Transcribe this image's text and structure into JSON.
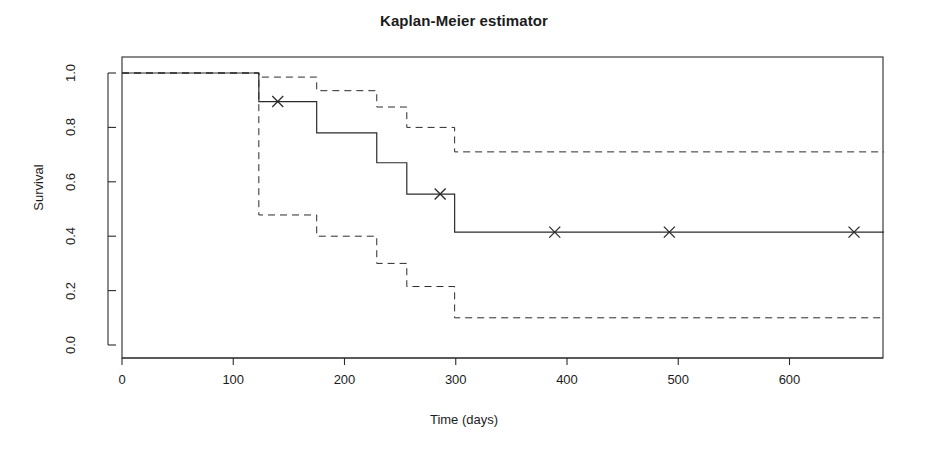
{
  "chart_data": {
    "type": "line",
    "title": "Kaplan-Meier estimator",
    "xlabel": "Time (days)",
    "ylabel": "Survival",
    "xlim": [
      0,
      685
    ],
    "ylim": [
      0.0,
      1.0
    ],
    "grid": false,
    "legend": null,
    "xticks": [
      0,
      100,
      200,
      300,
      400,
      500,
      600
    ],
    "xtick_labels": [
      "0",
      "100",
      "200",
      "300",
      "400",
      "500",
      "600"
    ],
    "yticks": [
      0.0,
      0.2,
      0.4,
      0.6,
      0.8,
      1.0
    ],
    "ytick_labels": [
      "0.0",
      "0.2",
      "0.4",
      "0.6",
      "0.8",
      "1.0"
    ],
    "series": [
      {
        "name": "Survival estimate",
        "style": "solid",
        "x": [
          0,
          123,
          175,
          229,
          256,
          299,
          685
        ],
        "y": [
          1.0,
          0.895,
          0.78,
          0.67,
          0.555,
          0.415,
          0.415
        ]
      },
      {
        "name": "Upper 95% confidence limit",
        "style": "dashed",
        "x": [
          0,
          123,
          175,
          229,
          256,
          299,
          685
        ],
        "y": [
          1.0,
          0.985,
          0.935,
          0.875,
          0.8,
          0.71,
          0.71
        ]
      },
      {
        "name": "Lower 95% confidence limit",
        "style": "dashed",
        "x": [
          0,
          123,
          175,
          229,
          256,
          299,
          685
        ],
        "y": [
          1.0,
          0.478,
          0.4,
          0.3,
          0.215,
          0.1,
          0.1
        ]
      }
    ],
    "censored_marks": {
      "symbol": "x",
      "points": [
        {
          "x": 140,
          "y": 0.895
        },
        {
          "x": 286,
          "y": 0.555
        },
        {
          "x": 389,
          "y": 0.415
        },
        {
          "x": 492,
          "y": 0.415
        },
        {
          "x": 658,
          "y": 0.415
        }
      ]
    }
  }
}
